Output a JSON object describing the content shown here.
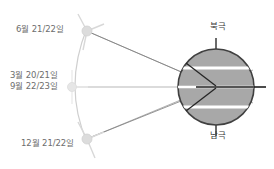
{
  "diagram": {
    "background_color": "#ffffff",
    "earth": {
      "fill_color": "#a8a8a8",
      "stroke_color": "#404040",
      "center_x": 216,
      "center_y": 87,
      "radius": 38,
      "latitude_line_color": "#ffffff",
      "axis_color": "#3a3a3a",
      "north_pole_label": "북극",
      "south_pole_label": "남극"
    },
    "sun_positions": [
      {
        "id": "summer-solstice",
        "label": "6월 21/22일",
        "x": 87,
        "y": 31,
        "glyph_color": "#d5d5d5"
      },
      {
        "id": "equinoxes",
        "label_line_1": "3월 20/21일",
        "label_line_2": "9월 22/23일",
        "x": 72,
        "y": 87,
        "glyph_color": "#e0e0e0"
      },
      {
        "id": "winter-solstice",
        "label": "12월 21/22일",
        "x": 87,
        "y": 139,
        "glyph_color": "#d5d5d5"
      }
    ],
    "rays": {
      "color": "#8f8f8f",
      "inner_color": "#262626",
      "description": "Sunlight rays from each sun position converging on Earth"
    },
    "orbit_arc": {
      "color": "#cfcfcf",
      "description": "Arc connecting the three sun positions"
    }
  }
}
